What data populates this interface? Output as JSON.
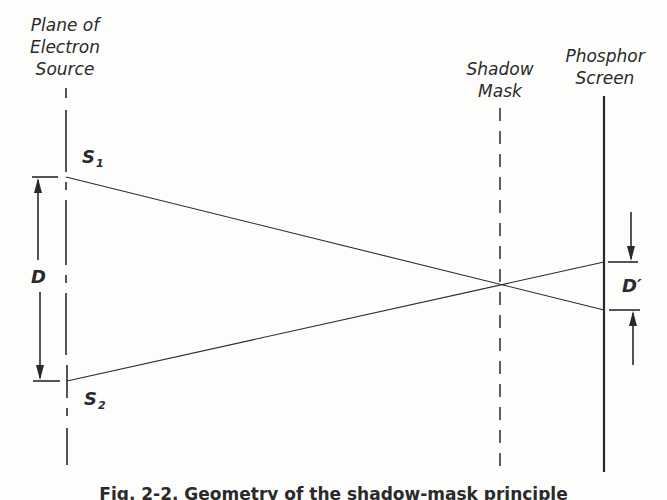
{
  "diagram": {
    "labels": {
      "source_plane": [
        "Plane of",
        "Electron",
        "Source"
      ],
      "shadow_mask": [
        "Shadow",
        "Mask"
      ],
      "phosphor_screen": [
        "Phosphor",
        "Screen"
      ]
    },
    "symbols": {
      "s1": {
        "letter": "S",
        "sub": "1"
      },
      "s2": {
        "letter": "S",
        "sub": "2"
      },
      "d": "D",
      "d_prime": "D′"
    },
    "caption": "Fig. 2-2. Geometry of the shadow-mask principle",
    "geometry": {
      "source_plane_x": 66,
      "shadow_mask_x": 500,
      "phosphor_screen_x": 604,
      "s1": [
        66,
        177
      ],
      "s2": [
        67,
        381
      ],
      "crossover": [
        500,
        285
      ],
      "screen_hit_upper": [
        604,
        262
      ],
      "screen_hit_lower": [
        604,
        310
      ]
    },
    "colors": {
      "ink": "#2a2a2a",
      "paper": "#fdfdfb"
    }
  }
}
